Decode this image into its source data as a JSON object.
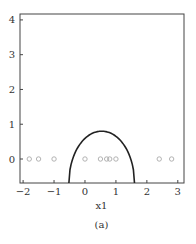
{
  "chart_data": {
    "type": "scatter",
    "title": "",
    "xlabel": "x1",
    "ylabel": "",
    "caption": "(a)",
    "xlim": [
      -2.1,
      3.2
    ],
    "ylim": [
      -0.69,
      4.17
    ],
    "xticks": [
      -2,
      -1,
      0,
      1,
      2,
      3
    ],
    "yticks": [
      0,
      1,
      2,
      3,
      4
    ],
    "grid": false,
    "series": [
      {
        "name": "points",
        "marker": "open-circle",
        "color": "#aaaaaa",
        "x": [
          -1.8,
          -1.5,
          -1.0,
          0.0,
          0.5,
          0.7,
          0.8,
          1.0,
          2.4,
          2.8
        ],
        "y": [
          0,
          0,
          0,
          0,
          0,
          0,
          0,
          0,
          0,
          0
        ]
      },
      {
        "name": "decision-boundary",
        "type": "curve",
        "color": "#222222",
        "shape": "parabola-arch",
        "x_left": -0.52,
        "x_right": 1.6,
        "peak_x": 0.54,
        "peak_y": 0.8
      }
    ]
  }
}
